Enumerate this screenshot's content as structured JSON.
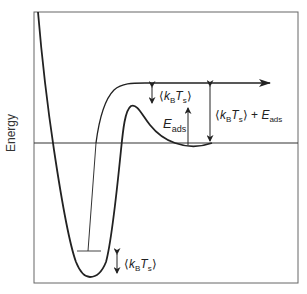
{
  "diagram": {
    "type": "potential-energy-diagram",
    "y_axis_label": "Energy",
    "labels": {
      "thermal_energy_top": {
        "open": "⟨",
        "k": "k",
        "k_sub": "B",
        "T": "T",
        "T_sub": "s",
        "close": "⟩"
      },
      "adsorption_energy": {
        "E": "E",
        "E_sub": "ads"
      },
      "total_energy": {
        "open": "⟨",
        "k": "k",
        "k_sub": "B",
        "T": "T",
        "T_sub": "s",
        "close": "⟩",
        "plus": " + ",
        "E": "E",
        "E_sub": "ads"
      },
      "thermal_energy_well": {
        "open": "⟨",
        "k": "k",
        "k_sub": "B",
        "T": "T",
        "T_sub": "s",
        "close": "⟩"
      }
    },
    "colors": {
      "line": "#222222",
      "frame": "#555555",
      "background": "#ffffff"
    },
    "elements": [
      "Deep chemisorption well with vibrational level bar",
      "Shallow physisorption well below zero-energy line",
      "Barrier peak between wells",
      "Incoming trajectory curve with arrow pointing right",
      "Zero-energy horizontal reference line"
    ]
  }
}
